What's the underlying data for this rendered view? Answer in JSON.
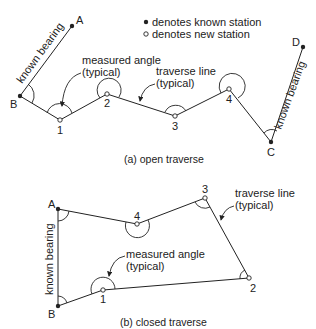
{
  "legend": {
    "known": "denotes known station",
    "new": "denotes new station"
  },
  "open_traverse": {
    "caption": "(a) open traverse",
    "stations": {
      "A": "A",
      "B": "B",
      "C": "C",
      "D": "D",
      "s1": "1",
      "s2": "2",
      "s3": "3",
      "s4": "4"
    },
    "labels": {
      "known_bearing_left": "known bearing",
      "known_bearing_right": "known bearing",
      "measured_angle_1": "measured angle",
      "measured_angle_2": "(typical)",
      "traverse_line_1": "traverse line",
      "traverse_line_2": "(typical)"
    }
  },
  "closed_traverse": {
    "caption": "(b) closed traverse",
    "stations": {
      "A": "A",
      "B": "B",
      "s1": "1",
      "s2": "2",
      "s3": "3",
      "s4": "4"
    },
    "labels": {
      "known_bearing": "known bearing",
      "measured_angle_1": "measured angle",
      "measured_angle_2": "(typical)",
      "traverse_line_1": "traverse line",
      "traverse_line_2": "(typical)"
    }
  },
  "colors": {
    "line": "#222222",
    "background": "#ffffff"
  }
}
